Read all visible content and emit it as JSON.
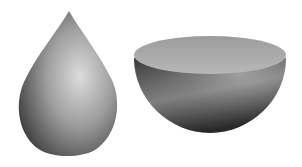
{
  "figure": {
    "shapes": [
      {
        "name": "teardrop",
        "fill_light": "#d8d8d8",
        "fill_dark": "#3a3a3a"
      },
      {
        "name": "hemisphere",
        "rim_color": "#a9a9a9",
        "fill_light": "#9a9a9a",
        "fill_dark": "#2e2e2e"
      }
    ],
    "background": "#ffffff"
  }
}
